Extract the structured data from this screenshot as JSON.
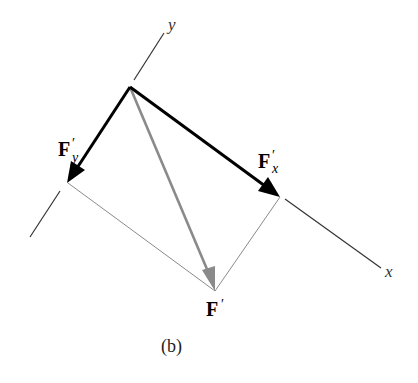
{
  "figure": {
    "caption": "(b)",
    "axes": {
      "x_label": "x",
      "y_label": "y"
    },
    "vectors": {
      "resultant": {
        "base": "F",
        "prime": "′",
        "color": "#8a8a8a"
      },
      "component_x": {
        "base": "F",
        "prime": "′",
        "sub": "x",
        "color": "#000000"
      },
      "component_y": {
        "base": "F",
        "prime": "′",
        "sub": "y",
        "color": "#000000"
      }
    },
    "colors": {
      "axis": "#333333",
      "construction_line": "#8a8a8a",
      "background": "#ffffff"
    }
  }
}
